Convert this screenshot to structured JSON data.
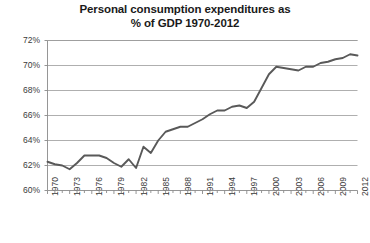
{
  "chart_data": {
    "type": "line",
    "title": "Personal consumption expenditures as\n% of GDP 1970-2012",
    "title_line1": "Personal consumption expenditures as",
    "title_line2": "% of GDP 1970-2012",
    "xlabel": "",
    "ylabel": "",
    "grid": true,
    "legend": "none",
    "xlim": [
      1970,
      2012
    ],
    "ylim": [
      60,
      72
    ],
    "ytick_labels": [
      "72%",
      "70%",
      "68%",
      "66%",
      "64%",
      "62%",
      "60%"
    ],
    "ytick_values": [
      72,
      70,
      68,
      66,
      64,
      62,
      60
    ],
    "xtick_labels": [
      "1970",
      "1973",
      "1976",
      "1979",
      "1982",
      "1985",
      "1988",
      "1991",
      "1994",
      "1997",
      "2000",
      "2003",
      "2006",
      "2009",
      "2012"
    ],
    "xtick_values": [
      1970,
      1973,
      1976,
      1979,
      1982,
      1985,
      1988,
      1991,
      1994,
      1997,
      2000,
      2003,
      2006,
      2009,
      2012
    ],
    "line_color": "#595959",
    "grid_color": "#9a9a9a",
    "x": [
      1970,
      1971,
      1972,
      1973,
      1974,
      1975,
      1976,
      1977,
      1978,
      1979,
      1980,
      1981,
      1982,
      1983,
      1984,
      1985,
      1986,
      1987,
      1988,
      1989,
      1990,
      1991,
      1992,
      1993,
      1994,
      1995,
      1996,
      1997,
      1998,
      1999,
      2000,
      2001,
      2002,
      2003,
      2004,
      2005,
      2006,
      2007,
      2008,
      2009,
      2010,
      2011,
      2012
    ],
    "values": [
      62.3,
      62.1,
      62.0,
      61.7,
      62.2,
      62.8,
      62.8,
      62.8,
      62.6,
      62.2,
      61.9,
      62.5,
      61.8,
      63.5,
      63.0,
      64.0,
      64.7,
      64.9,
      65.1,
      65.1,
      65.4,
      65.7,
      66.1,
      66.4,
      66.4,
      66.7,
      66.8,
      66.6,
      67.1,
      68.2,
      69.3,
      69.9,
      69.8,
      69.7,
      69.6,
      69.9,
      69.9,
      70.2,
      70.3,
      70.5,
      70.6,
      70.9,
      70.8
    ]
  }
}
